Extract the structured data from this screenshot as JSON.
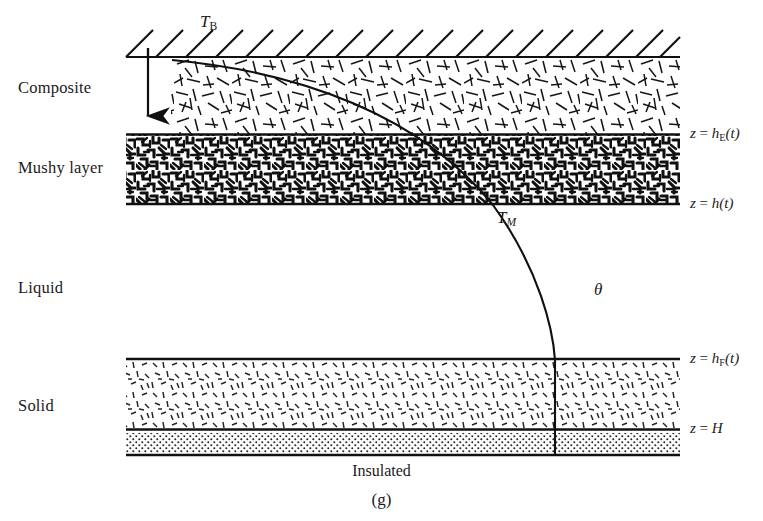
{
  "figure": {
    "caption": "(g)",
    "boundary_condition_bottom": "Insulated"
  },
  "layers": [
    {
      "id": "composite",
      "label": "Composite",
      "texture": "long-needles"
    },
    {
      "id": "mushy",
      "label": "Mushy layer",
      "texture": "dendritic-maze"
    },
    {
      "id": "liquid",
      "label": "Liquid",
      "texture": "none"
    },
    {
      "id": "solid",
      "label": "Solid",
      "texture": "short-dashes"
    }
  ],
  "interface_labels": [
    {
      "id": "h-E",
      "z": "z",
      "eq": "=",
      "h": "h",
      "sub": "E",
      "arg": "(t)"
    },
    {
      "id": "h",
      "z": "z",
      "eq": "=",
      "h": "h",
      "sub": "",
      "arg": "(t)"
    },
    {
      "id": "h-F",
      "z": "z",
      "eq": "=",
      "h": "h",
      "sub": "F",
      "arg": "(t)"
    },
    {
      "id": "H",
      "z": "z",
      "eq": "=",
      "h": "H",
      "sub": "",
      "arg": ""
    }
  ],
  "annotations": {
    "top_temperature": {
      "symbol": "T",
      "sub": "B"
    },
    "mush_temperature": {
      "symbol": "T",
      "sub": "M"
    },
    "theta": "θ"
  },
  "colors": {
    "ink": "#1a1a1a",
    "background": "#ffffff",
    "stipple": "#2b2b2b"
  }
}
